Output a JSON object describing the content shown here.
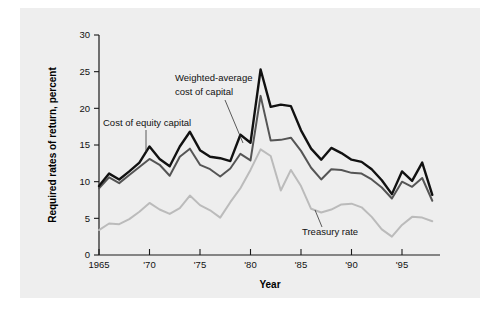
{
  "chart_data": {
    "type": "line",
    "title": "",
    "xlabel": "Year",
    "ylabel": "Required rates of return, percent",
    "xlim": [
      1965,
      1998
    ],
    "ylim": [
      0,
      30
    ],
    "grid": false,
    "legend_position": "inline-annotations",
    "x_tick_labels": [
      "1965",
      "'70",
      "'75",
      "'80",
      "'85",
      "'90",
      "'95"
    ],
    "x_tick_values": [
      1965,
      1970,
      1975,
      1980,
      1985,
      1990,
      1995
    ],
    "y_tick_labels": [
      "0",
      "5",
      "10",
      "15",
      "20",
      "25",
      "30"
    ],
    "y_tick_values": [
      0,
      5,
      10,
      15,
      20,
      25,
      30
    ],
    "x": [
      1965,
      1966,
      1967,
      1968,
      1969,
      1970,
      1971,
      1972,
      1973,
      1974,
      1975,
      1976,
      1977,
      1978,
      1979,
      1980,
      1981,
      1982,
      1983,
      1984,
      1985,
      1986,
      1987,
      1988,
      1989,
      1990,
      1991,
      1992,
      1993,
      1994,
      1995,
      1996,
      1997,
      1998
    ],
    "series": [
      {
        "name": "Cost of equity capital",
        "color": "#111111",
        "values": [
          9.4,
          11.1,
          10.3,
          11.4,
          12.6,
          14.8,
          13.1,
          12.1,
          14.8,
          16.8,
          14.3,
          13.4,
          13.2,
          12.8,
          16.4,
          15.3,
          25.3,
          20.2,
          20.5,
          20.3,
          17.0,
          14.5,
          13.0,
          14.6,
          13.9,
          13.0,
          12.7,
          11.7,
          10.2,
          8.3,
          11.4,
          10.1,
          12.6,
          8.2
        ]
      },
      {
        "name": "Weighted-average cost of capital",
        "color": "#555555",
        "values": [
          9.1,
          10.6,
          9.8,
          10.9,
          12.0,
          13.1,
          12.3,
          10.8,
          13.4,
          14.5,
          12.3,
          11.7,
          10.7,
          11.8,
          13.8,
          12.9,
          21.7,
          15.6,
          15.7,
          16.0,
          14.2,
          11.9,
          10.3,
          11.7,
          11.6,
          11.2,
          11.1,
          10.3,
          9.2,
          7.7,
          10.0,
          9.3,
          10.5,
          7.4
        ]
      },
      {
        "name": "Treasury rate",
        "color": "#bbbbbb",
        "values": [
          3.4,
          4.3,
          4.2,
          4.9,
          5.9,
          7.1,
          6.2,
          5.6,
          6.4,
          8.1,
          6.8,
          6.1,
          5.1,
          7.2,
          9.1,
          11.6,
          14.4,
          13.5,
          8.8,
          11.6,
          9.4,
          6.3,
          5.8,
          6.2,
          6.9,
          7.0,
          6.5,
          5.2,
          3.5,
          2.5,
          4.1,
          5.2,
          5.1,
          4.6
        ]
      }
    ],
    "annotations": [
      {
        "text_line1": "Cost of equity capital",
        "text_line2": "",
        "target_year": 1969,
        "target_value": 12.8
      },
      {
        "text_line1": "Weighted-average",
        "text_line2": "cost of capital",
        "target_year": 1978,
        "target_value": 12.0
      },
      {
        "text_line1": "Treasury rate",
        "text_line2": "",
        "target_year": 1987,
        "target_value": 5.9
      }
    ]
  },
  "annotation_text": {
    "cost_of_equity": "Cost of equity capital",
    "wacc_line1": "Weighted-average",
    "wacc_line2": "cost of capital",
    "treasury": "Treasury rate"
  }
}
